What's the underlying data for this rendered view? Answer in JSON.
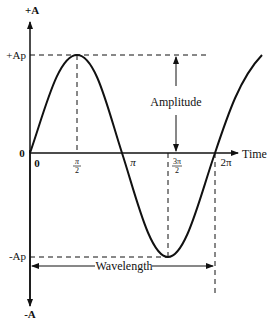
{
  "diagram": {
    "y_axis": {
      "top_label": "+A",
      "bottom_label": "-A",
      "origin_label": "0"
    },
    "x_axis": {
      "label": "Time",
      "ticks": [
        "0",
        "π/2",
        "π",
        "3π/2",
        "2π"
      ]
    },
    "levels": {
      "positive_peak": "+Ap",
      "negative_peak": "-Ap"
    },
    "annotations": {
      "amplitude": "Amplitude",
      "wavelength": "Wavelength"
    },
    "ticks": {
      "t0": "0",
      "t_half_pi_num": "π",
      "t_half_pi_den": "2",
      "t_pi": "π",
      "t_3half_pi_num": "3π",
      "t_3half_pi_den": "2",
      "t_2pi": "2π"
    },
    "colors": {
      "stroke": "#111111",
      "background": "#ffffff"
    }
  }
}
